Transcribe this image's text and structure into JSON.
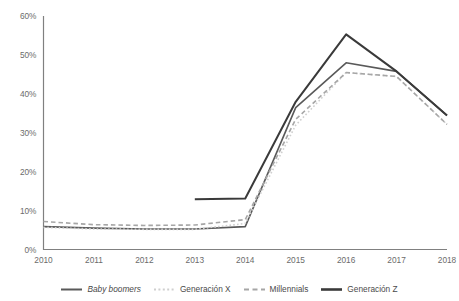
{
  "chart_data": {
    "type": "line",
    "title": "",
    "subtitle": "",
    "xlabel": "",
    "ylabel": "",
    "x": [
      2010,
      2011,
      2012,
      2013,
      2014,
      2015,
      2016,
      2017,
      2018
    ],
    "categories": [
      "2010",
      "2011",
      "2012",
      "2013",
      "2014",
      "2015",
      "2016",
      "2017",
      "2018"
    ],
    "xtick_labels": [
      "2010",
      "2011",
      "2012",
      "2013",
      "2014",
      "2015",
      "2016",
      "2017",
      "2018"
    ],
    "ytick_labels": [
      "0%",
      "10%",
      "20%",
      "30%",
      "40%",
      "50%",
      "60%"
    ],
    "ytick_values": [
      0,
      10,
      20,
      30,
      40,
      50,
      60
    ],
    "ylim": [
      0,
      60
    ],
    "xlim": [
      2010,
      2018
    ],
    "grid": false,
    "legend_position": "bottom",
    "series": [
      {
        "name": "Baby boomers",
        "label_style": "italic",
        "color": "#595959",
        "dash": "solid",
        "width": 1.6,
        "values": [
          6.0,
          5.6,
          5.4,
          5.4,
          6.0,
          36.5,
          48.0,
          45.8,
          34.5
        ]
      },
      {
        "name": "Generación X",
        "label_style": "normal",
        "color": "#cfcfcf",
        "dash": "dotted",
        "width": 1.6,
        "values": [
          5.8,
          5.4,
          5.3,
          5.3,
          6.8,
          32.0,
          45.5,
          44.5,
          32.2
        ]
      },
      {
        "name": "Millennials",
        "label_style": "normal",
        "color": "#a6a6a6",
        "dash": "dashed",
        "width": 1.6,
        "values": [
          7.3,
          6.5,
          6.3,
          6.4,
          7.8,
          33.5,
          45.5,
          44.5,
          32.2
        ]
      },
      {
        "name": "Generación Z",
        "label_style": "normal",
        "color": "#3a3a3a",
        "dash": "solid",
        "width": 2.0,
        "values": [
          null,
          null,
          null,
          13.0,
          13.2,
          38.0,
          55.3,
          45.8,
          34.5
        ]
      }
    ]
  },
  "legend": {
    "items": [
      {
        "label": "Baby boomers"
      },
      {
        "label": "Generación X"
      },
      {
        "label": "Millennials"
      },
      {
        "label": "Generación Z"
      }
    ]
  },
  "axes": {
    "y_labels": [
      "60%",
      "50%",
      "40%",
      "30%",
      "20%",
      "10%",
      "0%"
    ],
    "x_labels": [
      "2010",
      "2011",
      "2012",
      "2013",
      "2014",
      "2015",
      "2016",
      "2017",
      "2018"
    ]
  },
  "colors": {
    "axis": "#808080",
    "text": "#6b6b6b",
    "baby_boomers": "#595959",
    "generacion_x": "#cfcfcf",
    "millennials": "#a6a6a6",
    "generacion_z": "#3a3a3a",
    "background": "#ffffff"
  }
}
